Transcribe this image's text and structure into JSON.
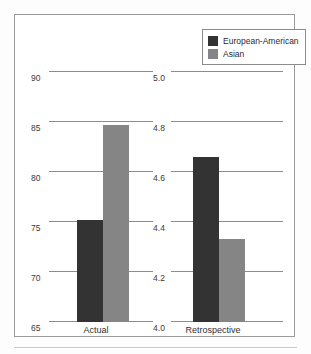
{
  "figure": {
    "background_color": "#fdfdfd",
    "frame_color": "#9a9a9a"
  },
  "legend": {
    "position": "top-right",
    "entries": [
      {
        "label": "European-American",
        "color": "#333333",
        "swatch_name": "legend-swatch-european-american"
      },
      {
        "label": "Asian",
        "color": "#858585",
        "swatch_name": "legend-swatch-asian"
      }
    ]
  },
  "panels": [
    {
      "id": "actual",
      "category": "Actual",
      "axis_ticks": [
        "90",
        "85",
        "80",
        "75",
        "70",
        "65"
      ],
      "ylim": [
        65,
        90
      ],
      "bars": [
        {
          "series": "European-American",
          "value": 75.2,
          "color": "#333333"
        },
        {
          "series": "Asian",
          "value": 84.7,
          "color": "#858585"
        }
      ]
    },
    {
      "id": "retrospective",
      "category": "Retrospective",
      "axis_ticks": [
        "5.0",
        "4.8",
        "4.6",
        "4.4",
        "4.2",
        "4.0"
      ],
      "ylim": [
        4.0,
        5.0
      ],
      "bars": [
        {
          "series": "European-American",
          "value": 4.66,
          "color": "#333333"
        },
        {
          "series": "Asian",
          "value": 4.33,
          "color": "#858585"
        }
      ]
    }
  ],
  "caption": {
    "text": ""
  },
  "chart_data": {
    "type": "bar",
    "title": "",
    "subtitle": "",
    "xlabel": "",
    "ylabel": "",
    "grid": true,
    "legend_position": "top-right",
    "panel_layout": "side-by-side",
    "categories": [
      "Actual",
      "Retrospective"
    ],
    "series": [
      {
        "name": "European-American",
        "color": "#333333",
        "values": [
          75.2,
          4.66
        ]
      },
      {
        "name": "Asian",
        "color": "#858585",
        "values": [
          84.7,
          4.33
        ]
      }
    ],
    "panels": [
      {
        "name": "Actual",
        "ylim": [
          65,
          90
        ],
        "yticks": [
          65,
          70,
          75,
          80,
          85,
          90
        ],
        "ytick_labels": [
          "65",
          "70",
          "75",
          "80",
          "85",
          "90"
        ],
        "values": {
          "European-American": 75.2,
          "Asian": 84.7
        }
      },
      {
        "name": "Retrospective",
        "ylim": [
          4.0,
          5.0
        ],
        "yticks": [
          4.0,
          4.2,
          4.4,
          4.6,
          4.8,
          5.0
        ],
        "ytick_labels": [
          "4.0",
          "4.2",
          "4.4",
          "4.6",
          "4.8",
          "5.0"
        ],
        "values": {
          "European-American": 4.66,
          "Asian": 4.33
        }
      }
    ]
  }
}
